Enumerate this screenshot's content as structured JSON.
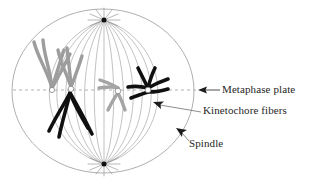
{
  "diagram": {
    "type": "cell-biology-schematic",
    "background_color": "#ffffff",
    "cell": {
      "name": "cell-outline",
      "shape": "ellipse",
      "center_x": 103,
      "center_y": 91,
      "radius_x": 91,
      "radius_y": 82,
      "stroke_color": "#9a9a9a",
      "stroke_width": 0.8
    },
    "metaphase_plate_line": {
      "name": "metaphase-plate-dashed-line",
      "x1": 13,
      "x2": 196,
      "y": 90,
      "stroke_color": "#b0a8a8",
      "dash": "3 3"
    },
    "poles": [
      {
        "name": "spindle-pole-top",
        "x": 104,
        "y": 20,
        "dot_color": "#111111",
        "aster_rays": 12
      },
      {
        "name": "spindle-pole-bottom",
        "x": 104,
        "y": 164,
        "dot_color": "#111111",
        "aster_rays": 12
      }
    ],
    "spindle": {
      "name": "spindle-fibers",
      "fiber_count": 13,
      "stroke_color": "#a8a8a8",
      "stroke_width": 0.7
    },
    "chromosomes": [
      {
        "name": "chromosome-gray-left-outer",
        "color": "#9d9d9d",
        "shape": "v-arms"
      },
      {
        "name": "chromosome-gray-left-inner",
        "color": "#9d9d9d",
        "shape": "v-arms"
      },
      {
        "name": "chromosome-black-lower-left",
        "color": "#101010",
        "shape": "v-arms"
      },
      {
        "name": "chromosome-gray-center",
        "color": "#a5a5a5",
        "shape": "x-shape"
      },
      {
        "name": "chromosome-black-right",
        "color": "#101010",
        "shape": "x-shape"
      }
    ],
    "kinetochores": [
      {
        "name": "kinetochore-left",
        "x": 52,
        "y": 90
      },
      {
        "name": "kinetochore-left-inner",
        "x": 71,
        "y": 89
      },
      {
        "name": "kinetochore-center",
        "x": 118,
        "y": 91
      },
      {
        "name": "kinetochore-right",
        "x": 148,
        "y": 90
      }
    ],
    "colors": {
      "text": "#262626",
      "cell_outline": "#9a9a9a",
      "spindle_fiber": "#a8a8a8",
      "chromosome_gray": "#9d9d9d",
      "chromosome_black": "#101010",
      "dashed_plate": "#b0a8a8",
      "leader_line": "#6e6e6e"
    }
  },
  "labels": {
    "metaphase_plate": "Metaphase plate",
    "kinetochore_fibers": "Kinetochore fibers",
    "spindle": "Spindle"
  },
  "annotations": [
    {
      "name": "pointer-metaphase-plate",
      "label_key": "metaphase_plate",
      "arrow_tip_x": 199,
      "arrow_tip_y": 90,
      "arrow_direction": "left",
      "leader_from_x": 220,
      "leader_from_y": 90
    },
    {
      "name": "pointer-kinetochore-fibers",
      "label_key": "kinetochore_fibers",
      "arrow_tip_x": 154,
      "arrow_tip_y": 103,
      "arrow_direction": "upper-left",
      "leader_from_x": 201,
      "leader_from_y": 112
    },
    {
      "name": "pointer-spindle",
      "label_key": "spindle",
      "arrow_tip_x": 177,
      "arrow_tip_y": 129,
      "arrow_direction": "upper-left",
      "leader_from_x": 188,
      "leader_from_y": 141
    }
  ]
}
